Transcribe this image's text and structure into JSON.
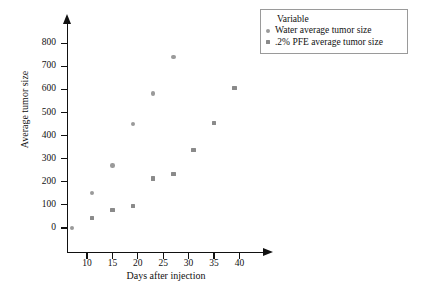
{
  "chart_data": {
    "type": "scatter",
    "title": "",
    "xlabel": "Days after injection",
    "ylabel": "Average tumor size",
    "xlim": [
      5,
      43
    ],
    "ylim": [
      -40,
      830
    ],
    "xticks": [
      10,
      15,
      20,
      25,
      30,
      35,
      40
    ],
    "yticks": [
      0,
      100,
      200,
      300,
      400,
      500,
      600,
      700,
      800
    ],
    "grid": false,
    "legend_position": "top-right",
    "legend_title": "Variable",
    "series": [
      {
        "name": "Water average tumor size",
        "marker": "circle",
        "color": "#9a9a9a",
        "x": [
          7,
          11,
          15,
          19,
          23,
          27
        ],
        "y": [
          0,
          152,
          270,
          450,
          583,
          740
        ]
      },
      {
        "name": ".2% PFE average tumor size",
        "marker": "square",
        "color": "#8a8a8a",
        "x": [
          11,
          15,
          19,
          23,
          27,
          31,
          35,
          39
        ],
        "y": [
          42,
          78,
          94,
          215,
          235,
          337,
          455,
          605
        ]
      }
    ]
  },
  "axes": {
    "y_tick_labels": [
      "800",
      "700",
      "600",
      "500",
      "400",
      "300",
      "200",
      "100",
      "0"
    ],
    "x_tick_labels": [
      "10",
      "15",
      "20",
      "25",
      "30",
      "35",
      "40"
    ],
    "y_title": "Average tumor size",
    "x_title": "Days after injection"
  },
  "legend": {
    "title": "Variable",
    "entries": [
      {
        "label": "Water average tumor size",
        "marker": "circle-marker"
      },
      {
        "label": ".2% PFE average tumor size",
        "marker": "square-marker"
      }
    ]
  }
}
